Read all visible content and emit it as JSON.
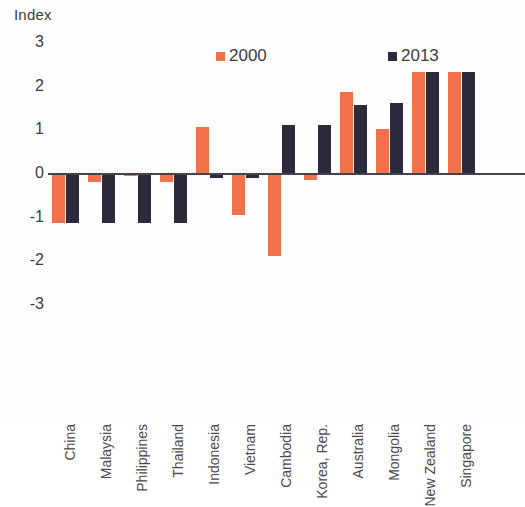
{
  "chart_data": {
    "type": "bar",
    "title": "",
    "ylabel": "Index",
    "xlabel": "",
    "ylim": [
      -3,
      3
    ],
    "yticks": [
      3,
      2,
      1,
      0,
      -1,
      -2,
      -3
    ],
    "grid": false,
    "legend_position": "top-center",
    "colors": {
      "series_2000": "#f2714a",
      "series_2013": "#2b2b3c",
      "axis": "#43434f",
      "text": "#3c3c3c"
    },
    "categories": [
      "China",
      "Malaysia",
      "Philippines",
      "Thailand",
      "Indonesia",
      "Vietnam",
      "Cambodia",
      "Korea, Rep.",
      "Australia",
      "Mongolia",
      "New Zealand",
      "Singapore"
    ],
    "series": [
      {
        "name": "2000",
        "values": [
          -1.15,
          -0.2,
          -0.08,
          -0.2,
          1.05,
          -0.95,
          -1.9,
          -0.15,
          1.85,
          1.0,
          2.3,
          2.3
        ]
      },
      {
        "name": "2013",
        "values": [
          -1.15,
          -1.15,
          -1.15,
          -1.15,
          -0.12,
          -0.12,
          1.1,
          1.1,
          1.55,
          1.6,
          2.3,
          2.3
        ]
      }
    ]
  },
  "legend": {
    "items": [
      {
        "label": "2000",
        "color_key": "series_2000"
      },
      {
        "label": "2013",
        "color_key": "series_2013"
      }
    ]
  },
  "axis": {
    "y_title": "Index",
    "y_tick_labels": [
      "3",
      "2",
      "1",
      "0",
      "-1",
      "-2",
      "-3"
    ]
  }
}
